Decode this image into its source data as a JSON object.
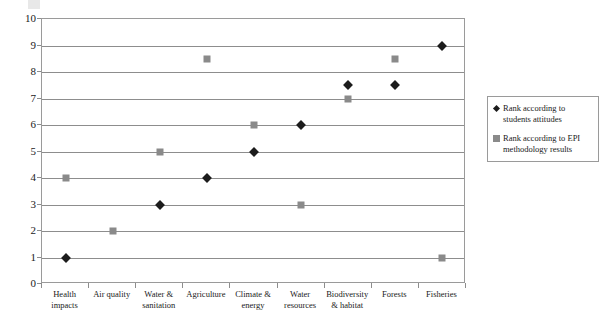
{
  "chart_data": {
    "type": "scatter",
    "title": "",
    "xlabel": "",
    "ylabel": "",
    "ylim": [
      0,
      10
    ],
    "yticks": [
      0,
      1,
      2,
      3,
      4,
      5,
      6,
      7,
      8,
      9,
      10
    ],
    "grid": true,
    "legend_position": "right",
    "categories": [
      "Health impacts",
      "Air quality",
      "Water & sanitation",
      "Agriculture",
      "Climate & energy",
      "Water resources",
      "Biodiversity & habitat",
      "Forests",
      "Fisheries"
    ],
    "series": [
      {
        "name": "Rank according to students attitudes",
        "marker": "diamond",
        "color": "#1c1c1c",
        "values": [
          1,
          null,
          3,
          4,
          5,
          6,
          7.5,
          7.5,
          9
        ]
      },
      {
        "name": "Rank according to EPI methodology results",
        "marker": "square",
        "color": "#8a8a8a",
        "values": [
          4,
          2,
          5,
          8.5,
          6,
          3,
          7,
          8.5,
          1
        ]
      }
    ]
  },
  "axis": {
    "y_tick_labels": [
      "0",
      "1",
      "2",
      "3",
      "4",
      "5",
      "6",
      "7",
      "8",
      "9",
      "10"
    ]
  },
  "legend": {
    "entries": [
      {
        "label": "Rank according to students attitudes",
        "marker": "diamond"
      },
      {
        "label": "Rank according to EPI methodology results",
        "marker": "square"
      }
    ]
  }
}
